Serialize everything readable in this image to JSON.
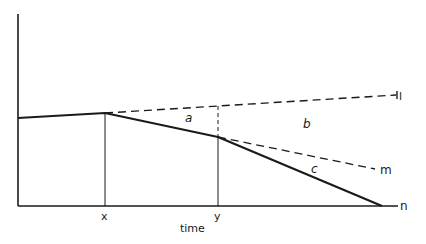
{
  "diagram": {
    "type": "line-diagram",
    "axes": {
      "x_label": "time",
      "x_ticks": [
        "x",
        "y"
      ],
      "y_label": ""
    },
    "regions": {
      "a": "a",
      "b": "b",
      "c": "c"
    },
    "lines": {
      "l": "l",
      "m": "m",
      "n": "n"
    },
    "colors": {
      "ink": "#1a1a1a",
      "background": "#ffffff"
    }
  }
}
